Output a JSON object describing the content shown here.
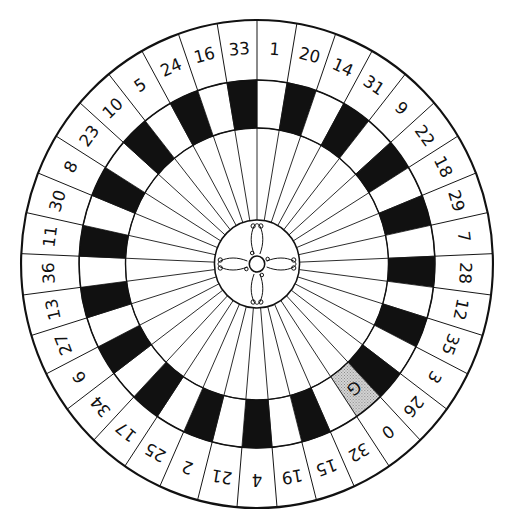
{
  "diagram": {
    "type": "roulette-wheel",
    "pockets": [
      {
        "label": "1",
        "color": "red"
      },
      {
        "label": "20",
        "color": "black"
      },
      {
        "label": "14",
        "color": "red"
      },
      {
        "label": "31",
        "color": "black"
      },
      {
        "label": "9",
        "color": "red"
      },
      {
        "label": "22",
        "color": "black"
      },
      {
        "label": "18",
        "color": "red"
      },
      {
        "label": "29",
        "color": "black"
      },
      {
        "label": "7",
        "color": "red"
      },
      {
        "label": "28",
        "color": "black"
      },
      {
        "label": "12",
        "color": "red"
      },
      {
        "label": "35",
        "color": "black"
      },
      {
        "label": "3",
        "color": "red"
      },
      {
        "label": "26",
        "color": "black"
      },
      {
        "label": "0",
        "color": "green"
      },
      {
        "label": "32",
        "color": "red"
      },
      {
        "label": "15",
        "color": "black"
      },
      {
        "label": "19",
        "color": "red"
      },
      {
        "label": "4",
        "color": "black"
      },
      {
        "label": "21",
        "color": "red"
      },
      {
        "label": "2",
        "color": "black"
      },
      {
        "label": "25",
        "color": "red"
      },
      {
        "label": "17",
        "color": "black"
      },
      {
        "label": "34",
        "color": "red"
      },
      {
        "label": "6",
        "color": "black"
      },
      {
        "label": "27",
        "color": "red"
      },
      {
        "label": "13",
        "color": "black"
      },
      {
        "label": "36",
        "color": "red"
      },
      {
        "label": "11",
        "color": "black"
      },
      {
        "label": "30",
        "color": "red"
      },
      {
        "label": "8",
        "color": "black"
      },
      {
        "label": "23",
        "color": "red"
      },
      {
        "label": "10",
        "color": "black"
      },
      {
        "label": "5",
        "color": "red"
      },
      {
        "label": "24",
        "color": "black"
      },
      {
        "label": "16",
        "color": "red"
      },
      {
        "label": "33",
        "color": "black"
      }
    ],
    "green_marker": "G",
    "render_colors": {
      "black": "#111111",
      "red": "#ffffff",
      "green": "#bdbdbd",
      "line": "#111111",
      "background": "#ffffff"
    }
  }
}
